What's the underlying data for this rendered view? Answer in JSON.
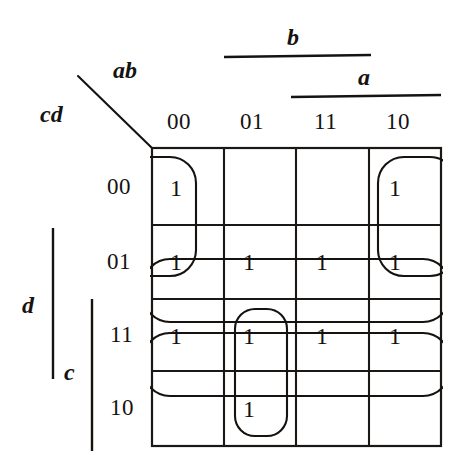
{
  "diagram": {
    "type": "karnaugh-map",
    "title_visible": false,
    "axis_labels": {
      "columns_var": "ab",
      "rows_var": "cd"
    },
    "column_headers": [
      "00",
      "01",
      "11",
      "10"
    ],
    "row_headers": [
      "00",
      "01",
      "11",
      "10"
    ],
    "grouping_bars": {
      "b": {
        "label": "b",
        "orientation": "horizontal",
        "spans_columns": [
          "01",
          "11"
        ]
      },
      "a": {
        "label": "a",
        "orientation": "horizontal",
        "spans_columns": [
          "11",
          "10"
        ]
      },
      "d": {
        "label": "d",
        "orientation": "vertical",
        "spans_rows": [
          "01",
          "11"
        ]
      },
      "c": {
        "label": "c",
        "orientation": "vertical",
        "spans_rows": [
          "11",
          "10"
        ]
      }
    },
    "cells": [
      {
        "row": "00",
        "col": "00",
        "value": "1"
      },
      {
        "row": "00",
        "col": "01",
        "value": ""
      },
      {
        "row": "00",
        "col": "11",
        "value": ""
      },
      {
        "row": "00",
        "col": "10",
        "value": "1"
      },
      {
        "row": "01",
        "col": "00",
        "value": "1"
      },
      {
        "row": "01",
        "col": "01",
        "value": "1"
      },
      {
        "row": "01",
        "col": "11",
        "value": "1"
      },
      {
        "row": "01",
        "col": "10",
        "value": "1"
      },
      {
        "row": "11",
        "col": "00",
        "value": "1"
      },
      {
        "row": "11",
        "col": "01",
        "value": "1"
      },
      {
        "row": "11",
        "col": "11",
        "value": "1"
      },
      {
        "row": "11",
        "col": "10",
        "value": "1"
      },
      {
        "row": "10",
        "col": "00",
        "value": ""
      },
      {
        "row": "10",
        "col": "01",
        "value": "1"
      },
      {
        "row": "10",
        "col": "11",
        "value": ""
      },
      {
        "row": "10",
        "col": "10",
        "value": ""
      }
    ],
    "groups": [
      {
        "name": "wrap-corner-group-left",
        "covers": [
          "00/00",
          "01/00"
        ],
        "wraps": true
      },
      {
        "name": "wrap-corner-group-right",
        "covers": [
          "00/10",
          "01/10"
        ],
        "wraps": true
      },
      {
        "name": "row-01-group",
        "covers": [
          "01/00",
          "01/01",
          "01/11",
          "01/10"
        ],
        "wraps": true
      },
      {
        "name": "row-11-group",
        "covers": [
          "11/00",
          "11/01",
          "11/11",
          "11/10"
        ],
        "wraps": true
      },
      {
        "name": "col-01-vertical-group",
        "covers": [
          "11/01",
          "10/01"
        ],
        "wraps": false
      }
    ],
    "colors": {
      "ink": "#15120f",
      "background": "#ffffff",
      "grid": "#1a1714"
    }
  }
}
